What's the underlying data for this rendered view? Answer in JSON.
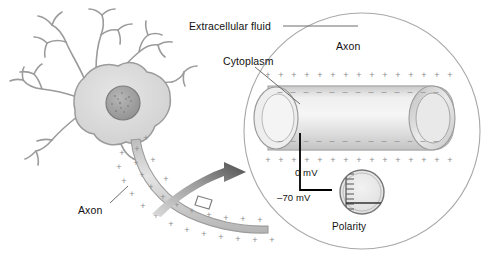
{
  "figure": {
    "background_color": "#ffffff",
    "text_color": "#111111"
  },
  "labels": {
    "extracellular_fluid": "Extracellular fluid",
    "cytoplasm": "Cytoplasm",
    "axon_inset": "Axon",
    "axon_neuron": "Axon",
    "polarity": "Polarity"
  },
  "meter": {
    "top_value": "0 mV",
    "bottom_value": "–70 mV",
    "caption": "Polarity",
    "needle_position": "bottom",
    "tick_count": 9
  },
  "charges": {
    "outside_symbol": "+",
    "inside_symbol": "–",
    "inset_top_outside_count": 17,
    "inset_top_inside_count": 16,
    "inset_bottom_inside_count": 16,
    "inset_bottom_outside_count": 17,
    "neuron_axon_outer_count": 16,
    "neuron_axon_inner_count": 14
  },
  "colors": {
    "cell_fill": "#d8d8d8",
    "cell_outline": "#8c8c8c",
    "nucleus_fill": "#9a9a9a",
    "membrane_gray": "#bdbdbd",
    "circle_outline": "#a8a8a8",
    "arrow_dark": "#575757",
    "arrow_light": "#d4d4d4",
    "charge_gray": "#8a8a8a",
    "electrode_black": "#000000"
  },
  "structure": {
    "inset_shape": "circle",
    "inset_center": [
      362,
      131
    ],
    "inset_radius": 118,
    "axon_cylinder": "horizontal cut-away tube",
    "neuron_parts": [
      "dendrites",
      "soma",
      "nucleus",
      "axon"
    ]
  }
}
